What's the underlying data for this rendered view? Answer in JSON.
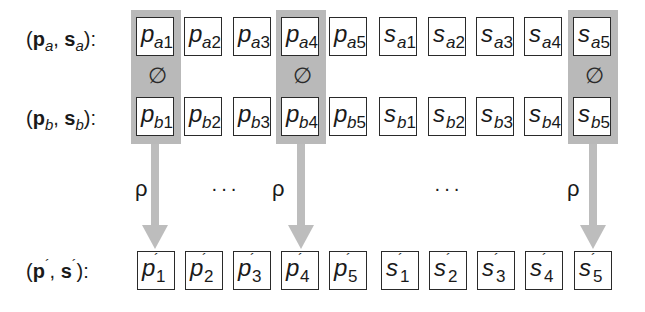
{
  "rows": {
    "a": {
      "label": {
        "open": "(",
        "p": "p",
        "p_sub": "a",
        "sep": ", ",
        "s": "s",
        "s_sub": "a",
        "close": "):"
      },
      "cells": [
        {
          "main": "p",
          "sub": "a",
          "idx": "1"
        },
        {
          "main": "p",
          "sub": "a",
          "idx": "2"
        },
        {
          "main": "p",
          "sub": "a",
          "idx": "3"
        },
        {
          "main": "p",
          "sub": "a",
          "idx": "4"
        },
        {
          "main": "p",
          "sub": "a",
          "idx": "5"
        },
        {
          "main": "s",
          "sub": "a",
          "idx": "1"
        },
        {
          "main": "s",
          "sub": "a",
          "idx": "2"
        },
        {
          "main": "s",
          "sub": "a",
          "idx": "3"
        },
        {
          "main": "s",
          "sub": "a",
          "idx": "4"
        },
        {
          "main": "s",
          "sub": "a",
          "idx": "5"
        }
      ]
    },
    "b": {
      "label": {
        "open": "(",
        "p": "p",
        "p_sub": "b",
        "sep": ", ",
        "s": "s",
        "s_sub": "b",
        "close": "):"
      },
      "cells": [
        {
          "main": "p",
          "sub": "b",
          "idx": "1"
        },
        {
          "main": "p",
          "sub": "b",
          "idx": "2"
        },
        {
          "main": "p",
          "sub": "b",
          "idx": "3"
        },
        {
          "main": "p",
          "sub": "b",
          "idx": "4"
        },
        {
          "main": "p",
          "sub": "b",
          "idx": "5"
        },
        {
          "main": "s",
          "sub": "b",
          "idx": "1"
        },
        {
          "main": "s",
          "sub": "b",
          "idx": "2"
        },
        {
          "main": "s",
          "sub": "b",
          "idx": "3"
        },
        {
          "main": "s",
          "sub": "b",
          "idx": "4"
        },
        {
          "main": "s",
          "sub": "b",
          "idx": "5"
        }
      ]
    },
    "result": {
      "label": {
        "open": "(",
        "p": "p",
        "prime": "´",
        "sep": ", ",
        "s": "s",
        "close": "):"
      },
      "cells": [
        {
          "main": "p",
          "prime": "´",
          "idx": "1"
        },
        {
          "main": "p",
          "prime": "´",
          "idx": "2"
        },
        {
          "main": "p",
          "prime": "´",
          "idx": "3"
        },
        {
          "main": "p",
          "prime": "´",
          "idx": "4"
        },
        {
          "main": "p",
          "prime": "´",
          "idx": "5"
        },
        {
          "main": "s",
          "prime": "´",
          "idx": "1"
        },
        {
          "main": "s",
          "prime": "´",
          "idx": "2"
        },
        {
          "main": "s",
          "prime": "´",
          "idx": "3"
        },
        {
          "main": "s",
          "prime": "´",
          "idx": "4"
        },
        {
          "main": "s",
          "prime": "´",
          "idx": "5"
        }
      ]
    }
  },
  "highlighted_columns": [
    1,
    4,
    10
  ],
  "operator_symbol": "∅",
  "mapping_symbol": "ρ",
  "ellipsis": "···",
  "colors": {
    "highlight": "#b9b9b9",
    "arrow": "#bdbdbd",
    "border": "#2a2a2a"
  }
}
